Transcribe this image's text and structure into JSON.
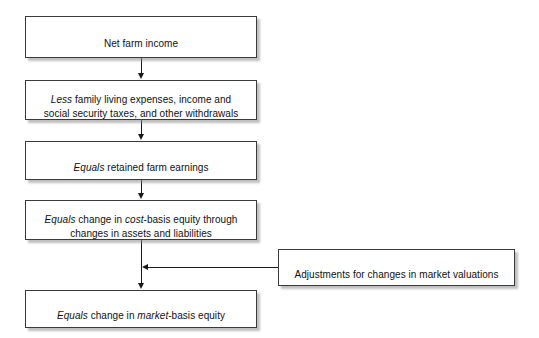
{
  "diagram": {
    "background_color": "#ffffff",
    "border_color": "#3a3a3a",
    "line_color": "#1a1a1a",
    "shadow_color": "#8c8c8c",
    "nodes": [
      {
        "id": "net-farm-income",
        "text": "Net farm income",
        "emphasis": []
      },
      {
        "id": "less-family-living-expenses",
        "text": "Less family living expenses, income and\nsocial security taxes, and other withdrawals",
        "emphasis": [
          "Less"
        ]
      },
      {
        "id": "equals-retained-farm-earnings",
        "text": "Equals retained farm earnings",
        "emphasis": [
          "Equals"
        ]
      },
      {
        "id": "equals-change-cost-basis-equity",
        "text": "Equals change in cost-basis equity through\nchanges in assets and liabilities",
        "emphasis": [
          "Equals",
          "cost"
        ]
      },
      {
        "id": "adjustments-market-valuations",
        "text": "Adjustments for changes in market valuations",
        "emphasis": []
      },
      {
        "id": "equals-change-market-basis-equity",
        "text": "Equals change in market-basis equity",
        "emphasis": [
          "Equals",
          "market"
        ]
      }
    ]
  }
}
